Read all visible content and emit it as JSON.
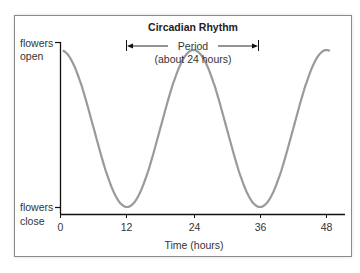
{
  "chart_data": {
    "type": "line",
    "title": "Circadian Rhythm",
    "xlabel": "Time (hours)",
    "ylabel": "",
    "x_ticks": [
      0,
      12,
      24,
      36,
      48
    ],
    "xlim": [
      0,
      50
    ],
    "y_tick_labels": {
      "top": [
        "flowers",
        "open"
      ],
      "bottom": [
        "flowers",
        "close"
      ]
    },
    "series": [
      {
        "name": "Flower opening",
        "color": "#9a9a9a",
        "x": [
          0,
          6,
          12,
          18,
          24,
          30,
          36,
          42,
          48,
          49
        ],
        "values": [
          0.02,
          0.5,
          1.0,
          0.5,
          0.0,
          0.5,
          1.0,
          0.5,
          0.0,
          0.05
        ]
      }
    ],
    "annotations": [
      {
        "text_line1": "Period",
        "text_line2": "(about 24 hours)",
        "from_x": 12,
        "to_x": 36
      }
    ],
    "grid": false
  }
}
